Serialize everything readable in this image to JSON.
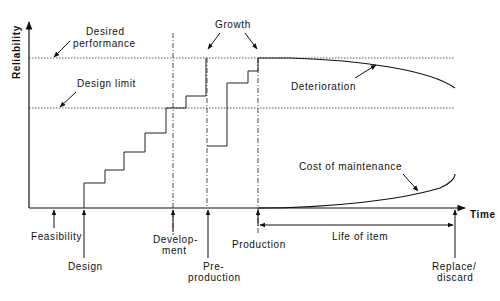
{
  "diagram": {
    "y_axis_label": "Reliability",
    "x_axis_label": "Time",
    "reference_lines": {
      "desired_performance": "Desired performance",
      "desired_performance_line1": "Desired",
      "desired_performance_line2": "performance",
      "design_limit": "Design limit"
    },
    "annotations": {
      "growth": "Growth",
      "deterioration": "Deterioration",
      "cost_of_maintenance": "Cost of maintenance",
      "life_of_item": "Life of item"
    },
    "phases": [
      {
        "id": "feasibility",
        "lines": [
          "Feasibility"
        ]
      },
      {
        "id": "design",
        "lines": [
          "Design"
        ]
      },
      {
        "id": "development",
        "lines": [
          "Develop-",
          "ment"
        ]
      },
      {
        "id": "pre-production",
        "lines": [
          "Pre-",
          "production"
        ]
      },
      {
        "id": "production",
        "lines": [
          "Production"
        ]
      },
      {
        "id": "replace-discard",
        "lines": [
          "Replace/",
          "discard"
        ]
      }
    ],
    "colors": {
      "line": "#111111",
      "background": "#ffffff"
    }
  }
}
